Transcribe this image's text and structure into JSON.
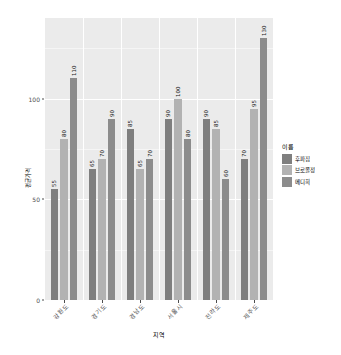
{
  "chart_data": {
    "type": "bar",
    "title": "",
    "subtitle": "",
    "xlabel": "지역",
    "ylabel": "평균가격",
    "categories": [
      "강원도",
      "경기도",
      "경남도",
      "서울시",
      "전라도",
      "제주도"
    ],
    "series": [
      {
        "name": "후파집",
        "color": "#7f7f7f",
        "values": [
          55,
          65,
          85,
          90,
          90,
          70
        ]
      },
      {
        "name": "브로콜정",
        "color": "#b2b2b2",
        "values": [
          80,
          70,
          65,
          100,
          85,
          95
        ]
      },
      {
        "name": "메디희",
        "color": "#8c8c8c",
        "values": [
          110,
          90,
          70,
          80,
          60,
          130
        ]
      }
    ],
    "ylim": [
      0,
      140
    ],
    "y_ticks": [
      0,
      50,
      100
    ],
    "y_tick_labels": [
      "0",
      "50",
      "100"
    ],
    "grid": true,
    "grid_color": "#ffffff",
    "panel_background": "#ebebeb",
    "legend_position": "right",
    "legend_title": "이름",
    "value_labels": true,
    "value_label_rotation": -90,
    "x_label_rotation": -45
  },
  "legend": {
    "title": "이름",
    "items": [
      {
        "label": "후파집",
        "color": "#7f7f7f"
      },
      {
        "label": "브로콜정",
        "color": "#b2b2b2"
      },
      {
        "label": "메디희",
        "color": "#8c8c8c"
      }
    ]
  },
  "axes": {
    "y_title": "평균가격",
    "x_title": "지역"
  }
}
